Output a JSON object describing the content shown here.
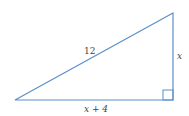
{
  "diagram": {
    "type": "right-triangle",
    "line_color": "#5b8fc9",
    "labels": {
      "hypotenuse": "12",
      "vertical_leg": "x",
      "horizontal_leg": "x + 4"
    },
    "right_angle_marker": true
  }
}
